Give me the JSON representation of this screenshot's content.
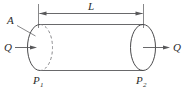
{
  "figure": {
    "type": "engineering-diagram",
    "labels": {
      "length": "L",
      "area": "A",
      "flow_in": "Q",
      "flow_out": "Q",
      "pressure_inlet_symbol": "P",
      "pressure_inlet_subscript": "1",
      "pressure_outlet_symbol": "P",
      "pressure_outlet_subscript": "2"
    },
    "colors": {
      "stroke": "#58585a",
      "hidden_stroke": "#7d7d80",
      "text": "#2b2b2b",
      "background": "#ffffff"
    },
    "annotations": {
      "length_dimension": "Dimension line spanning the full cylinder length, arrowheads at both ends",
      "area_leader": "Leader line from label A to the left circular face",
      "inlet_arrow": "Arrow pointing right into the left face",
      "outlet_arrow": "Arrow pointing right out of the right face",
      "left_face_style": "half solid, half dashed (hidden back edge)",
      "right_face_style": "solid ellipse"
    }
  }
}
